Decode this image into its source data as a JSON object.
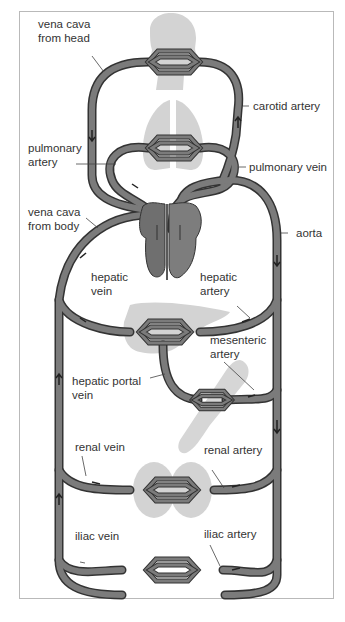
{
  "diagram": {
    "colors": {
      "vessel": "#7b7b7b",
      "vessel_outline": "#333333",
      "organ_silhouette": "#cfcfcf",
      "heart": "#6f6f6f",
      "frame_border": "#b9b9b9",
      "label_text": "#333333"
    },
    "organs": [
      "head",
      "lungs",
      "heart",
      "liver",
      "gut",
      "kidneys",
      "legs"
    ],
    "labels": {
      "vena_cava_head": {
        "line1": "vena cava",
        "line2": "from head"
      },
      "carotid_artery": {
        "line1": "carotid artery"
      },
      "pulmonary_artery": {
        "line1": "pulmonary",
        "line2": "artery"
      },
      "pulmonary_vein": {
        "line1": "pulmonary vein"
      },
      "vena_cava_body": {
        "line1": "vena cava",
        "line2": "from body"
      },
      "aorta": {
        "line1": "aorta"
      },
      "hepatic_vein": {
        "line1": "hepatic",
        "line2": "vein"
      },
      "hepatic_artery": {
        "line1": "hepatic",
        "line2": "artery"
      },
      "mesenteric_artery": {
        "line1": "mesenteric",
        "line2": "artery"
      },
      "hepatic_portal_vein": {
        "line1": "hepatic portal",
        "line2": "vein"
      },
      "renal_vein": {
        "line1": "renal vein"
      },
      "renal_artery": {
        "line1": "renal artery"
      },
      "iliac_vein": {
        "line1": "iliac vein"
      },
      "iliac_artery": {
        "line1": "iliac artery"
      }
    }
  }
}
